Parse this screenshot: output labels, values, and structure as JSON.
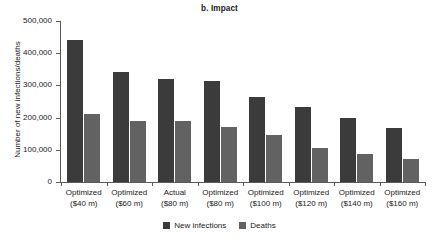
{
  "chart_data": {
    "type": "bar",
    "title": "b. Impact",
    "xlabel": "",
    "ylabel": "Number of new infections/deaths",
    "ylim": [
      0,
      500000
    ],
    "yticks": [
      0,
      100000,
      200000,
      300000,
      400000,
      500000
    ],
    "ytick_labels": [
      "0",
      "100,000",
      "200,000",
      "300,000",
      "400,000",
      "500,000"
    ],
    "grid": false,
    "legend_position": "bottom-center",
    "categories": [
      "Optimized ($40 m)",
      "Optimized ($60 m)",
      "Actual ($80 m)",
      "Optimized ($80 m)",
      "Optimized ($100 m)",
      "Optimized ($120 m)",
      "Optimized ($140 m)",
      "Optimized ($160 m)"
    ],
    "category_lines": [
      [
        "Optimized",
        "($40 m)"
      ],
      [
        "Optimized",
        "($60 m)"
      ],
      [
        "Actual",
        "($80 m)"
      ],
      [
        "Optimized",
        "($80 m)"
      ],
      [
        "Optimized",
        "($100 m)"
      ],
      [
        "Optimized",
        "($120 m)"
      ],
      [
        "Optimized",
        "($140 m)"
      ],
      [
        "Optimized",
        "($160 m)"
      ]
    ],
    "series": [
      {
        "name": "New infections",
        "color": "#3b3b3b",
        "values": [
          440000,
          341000,
          320000,
          314000,
          263000,
          234000,
          198000,
          169000
        ]
      },
      {
        "name": "Deaths",
        "color": "#626262",
        "values": [
          212000,
          189000,
          189000,
          170000,
          145000,
          105000,
          88000,
          72000
        ]
      }
    ]
  },
  "legend": {
    "items": [
      {
        "label": "New infections",
        "color": "#3b3b3b"
      },
      {
        "label": "Deaths",
        "color": "#626262"
      }
    ]
  },
  "colors": {
    "infections": "#3b3b3b",
    "deaths": "#626262",
    "axis": "#5a5a5a",
    "text": "#1a1a1a",
    "background": "#ffffff"
  }
}
